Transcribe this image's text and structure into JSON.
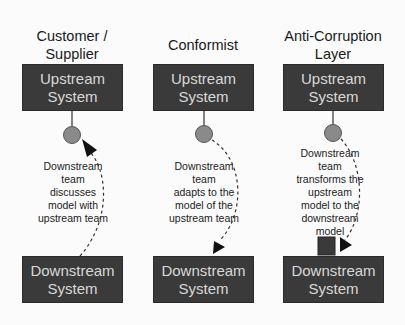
{
  "columns": [
    {
      "title_line1": "Customer /",
      "title_line2": "Supplier",
      "upstream_line1": "Upstream",
      "upstream_line2": "System",
      "description": [
        "Downstream",
        "team",
        "discusses",
        "model with",
        "upstream team"
      ],
      "downstream_line1": "Downstream",
      "downstream_line2": "System",
      "arrow_direction": "downstream-to-upstream"
    },
    {
      "title_line1": "Conformist",
      "title_line2": "",
      "upstream_line1": "Upstream",
      "upstream_line2": "System",
      "description": [
        "Downstream",
        "team",
        "adapts to the",
        "model of the",
        "upstream team"
      ],
      "downstream_line1": "Downstream",
      "downstream_line2": "System",
      "arrow_direction": "upstream-to-downstream"
    },
    {
      "title_line1": "Anti-Corruption",
      "title_line2": "Layer",
      "upstream_line1": "Upstream",
      "upstream_line2": "System",
      "description": [
        "Downstream",
        "team",
        "transforms the",
        "upstream",
        "model to the",
        "downstream",
        "model"
      ],
      "downstream_line1": "Downstream",
      "downstream_line2": "System",
      "arrow_direction": "upstream-to-acl-layer"
    }
  ],
  "colors": {
    "box_fill": "#3a3a3a",
    "box_text": "#d8d8d8",
    "interface_circle": "#8a8a8a",
    "acl_square": "#3a3a3a",
    "background": "#fbfbfb"
  }
}
